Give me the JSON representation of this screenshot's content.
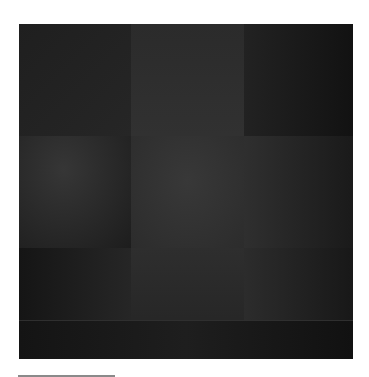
{
  "image": {
    "kind": "abstract-painting",
    "description": "Dark near-black square painting divided into a 3x3 grid of subtly different dark gray blocks forming a faint cross",
    "colors": {
      "background": "#ffffff",
      "base": "#1c1c1c",
      "darkest": "#141414",
      "mid": "#2a2a2a",
      "light": "#353535",
      "rule": "#8a8a8a"
    }
  }
}
